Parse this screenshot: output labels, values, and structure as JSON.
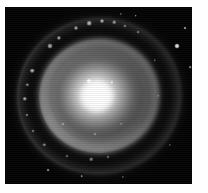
{
  "figure": {
    "kind": "astronomical-image",
    "colorspace": "grayscale",
    "frame": {
      "border_color": "#ffffff",
      "sky_color": "#040404",
      "core_color": "#ffffff",
      "border_left_px": 5,
      "border_top_px": 7,
      "image_width_px": 187,
      "image_height_px": 177
    },
    "structures": [
      {
        "name": "nucleus",
        "label": "bright central nucleus"
      },
      {
        "name": "bulge",
        "label": "central bulge"
      },
      {
        "name": "inner-ring",
        "label": "inner disk ring"
      },
      {
        "name": "outer-ring",
        "label": "outer spiral-arm ring"
      },
      {
        "name": "halo",
        "label": "faint outer halo"
      },
      {
        "name": "sky",
        "label": "background sky"
      }
    ],
    "point_sources": [
      {
        "name": "bright-knot-near-core",
        "x": 45.0,
        "y": 42.0,
        "size": 5.0,
        "brightness": 1.0
      },
      {
        "name": "faint-knot-near-core",
        "x": 57.0,
        "y": 42.5,
        "size": 3.4,
        "brightness": 0.55
      },
      {
        "name": "foreground-star-right",
        "x": 92.0,
        "y": 22.0,
        "size": 5.0,
        "brightness": 0.95
      },
      {
        "name": "foreground-star-upper-right",
        "x": 96.5,
        "y": 12.0,
        "size": 3.0,
        "brightness": 0.6
      },
      {
        "name": "foreground-star-far-right",
        "x": 99.0,
        "y": 34.0,
        "size": 2.6,
        "brightness": 0.5
      },
      {
        "name": "foreground-star-top",
        "x": 70.0,
        "y": 5.0,
        "size": 2.6,
        "brightness": 0.6
      },
      {
        "name": "foreground-star-top-left",
        "x": 62.0,
        "y": 4.0,
        "size": 2.2,
        "brightness": 0.5
      },
      {
        "name": "foreground-star-bottom-left",
        "x": 23.0,
        "y": 92.0,
        "size": 2.8,
        "brightness": 0.55
      },
      {
        "name": "foreground-star-bottom",
        "x": 41.0,
        "y": 95.5,
        "size": 2.6,
        "brightness": 0.55
      },
      {
        "name": "foreground-star-bottom-right",
        "x": 63.0,
        "y": 96.0,
        "size": 2.2,
        "brightness": 0.45
      },
      {
        "name": "foreground-star-lower-right",
        "x": 88.0,
        "y": 78.0,
        "size": 2.2,
        "brightness": 0.4
      }
    ],
    "arm_knots": [
      {
        "name": "knot-nw-1",
        "x": 24.0,
        "y": 22.0,
        "size": 5.0,
        "brightness": 0.85
      },
      {
        "name": "knot-nw-2",
        "x": 29.0,
        "y": 17.5,
        "size": 4.2,
        "brightness": 0.8
      },
      {
        "name": "knot-n-1",
        "x": 38.0,
        "y": 12.0,
        "size": 4.0,
        "brightness": 0.8
      },
      {
        "name": "knot-n-2",
        "x": 45.0,
        "y": 9.0,
        "size": 4.6,
        "brightness": 0.9
      },
      {
        "name": "knot-n-3",
        "x": 52.0,
        "y": 8.0,
        "size": 4.0,
        "brightness": 0.85
      },
      {
        "name": "knot-n-4",
        "x": 58.5,
        "y": 8.5,
        "size": 3.6,
        "brightness": 0.7
      },
      {
        "name": "knot-n-5",
        "x": 64.0,
        "y": 10.5,
        "size": 3.2,
        "brightness": 0.6
      },
      {
        "name": "knot-ne-1",
        "x": 71.0,
        "y": 14.0,
        "size": 3.0,
        "brightness": 0.55
      },
      {
        "name": "knot-w-1",
        "x": 14.5,
        "y": 36.0,
        "size": 4.6,
        "brightness": 0.85
      },
      {
        "name": "knot-w-2",
        "x": 12.0,
        "y": 44.0,
        "size": 3.4,
        "brightness": 0.6
      },
      {
        "name": "knot-w-3",
        "x": 10.5,
        "y": 52.0,
        "size": 4.4,
        "brightness": 0.8
      },
      {
        "name": "knot-w-4",
        "x": 11.5,
        "y": 61.0,
        "size": 3.2,
        "brightness": 0.6
      },
      {
        "name": "knot-sw-1",
        "x": 15.0,
        "y": 70.0,
        "size": 3.0,
        "brightness": 0.55
      },
      {
        "name": "knot-sw-2",
        "x": 21.0,
        "y": 78.0,
        "size": 3.4,
        "brightness": 0.6
      },
      {
        "name": "knot-s-1",
        "x": 33.0,
        "y": 84.0,
        "size": 3.0,
        "brightness": 0.5
      },
      {
        "name": "knot-s-2",
        "x": 46.0,
        "y": 86.0,
        "size": 3.6,
        "brightness": 0.6
      },
      {
        "name": "knot-s-3",
        "x": 55.0,
        "y": 85.0,
        "size": 3.0,
        "brightness": 0.5
      },
      {
        "name": "knot-inner-sw",
        "x": 31.0,
        "y": 66.0,
        "size": 3.2,
        "brightness": 0.55
      },
      {
        "name": "knot-inner-s",
        "x": 48.0,
        "y": 72.0,
        "size": 3.0,
        "brightness": 0.5
      },
      {
        "name": "knot-inner-se",
        "x": 62.0,
        "y": 66.0,
        "size": 2.6,
        "brightness": 0.4
      },
      {
        "name": "knot-e-1",
        "x": 80.0,
        "y": 30.0,
        "size": 2.6,
        "brightness": 0.4
      },
      {
        "name": "knot-e-2",
        "x": 82.0,
        "y": 50.0,
        "size": 2.6,
        "brightness": 0.4
      }
    ]
  }
}
